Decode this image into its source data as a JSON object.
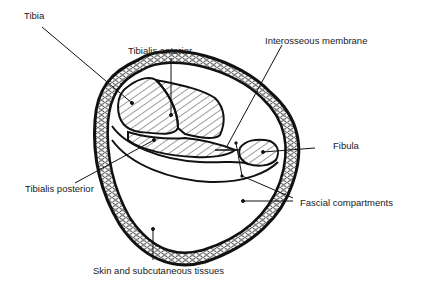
{
  "diagram": {
    "colors": {
      "ink": "#111111",
      "background": "#ffffff",
      "hatch": "#222222"
    },
    "labels": {
      "tibia": "Tibia",
      "tibialis_anterior": "Tibialis anterior",
      "interosseous_membrane": "Interosseous membrane",
      "fibula": "Fibula",
      "tibialis_posterior": "Tibialis posterior",
      "fascial_compartments": "Fascial compartments",
      "skin": "Skin and subcutaneous tissues"
    }
  }
}
